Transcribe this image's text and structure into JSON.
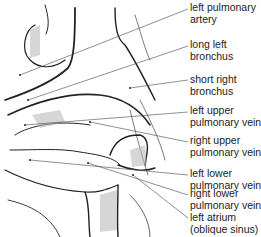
{
  "figure": {
    "labels": [
      {
        "line1": "left pulmonary",
        "line2": "artery",
        "top": 2
      },
      {
        "line1": "long left",
        "line2": "bronchus",
        "top": 39
      },
      {
        "line1": "short right",
        "line2": "bronchus",
        "top": 74
      },
      {
        "line1": "left upper",
        "line2": "pulmonary vein",
        "top": 105
      },
      {
        "line1": "right upper",
        "line2": "pulmonary vein",
        "top": 135
      },
      {
        "line1": "left lower",
        "line2": "pulmonary vein",
        "top": 168
      },
      {
        "line1": "right lower",
        "line2": "pulmonary vein",
        "top": 188
      },
      {
        "line1": "left atrium",
        "line2": "(oblique sinus)",
        "top": 212
      }
    ]
  }
}
